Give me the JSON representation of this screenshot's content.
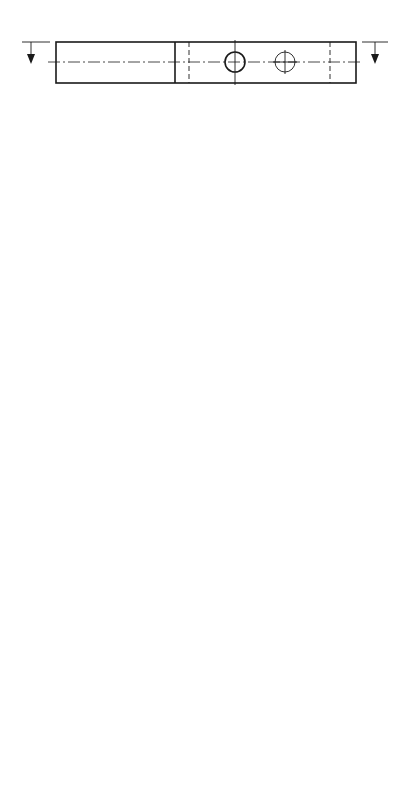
{
  "drawing": {
    "side_view": {
      "section_label_top": "Z",
      "section_label_bottom": "Z",
      "dim_thickness": "50"
    },
    "dimensions": {
      "top_edge": "230",
      "right_edge": "700",
      "chamfer_start": "560",
      "step_right": "150",
      "left_edge": "380",
      "bottom_edge": "150"
    },
    "datum_labels": {
      "x_top": "X",
      "x_bottom": "X",
      "y_left": "Y",
      "y_right": "Y"
    },
    "slot": {
      "text_line1": "SLOT",
      "text_line2": "OUT",
      "end_labels": [
        "E2",
        "E1"
      ]
    },
    "center_lines": [
      "C1",
      "C2",
      "C3",
      "C4"
    ],
    "main_bore": {
      "label": "F1"
    },
    "holes_a": [
      "A1",
      "A2",
      "A3",
      "A4"
    ],
    "holes_b": [
      "B1",
      "B2",
      "B3",
      "B4",
      "B5",
      "B6"
    ],
    "holes_d": [
      "D1",
      "D2",
      "D3",
      "D4"
    ]
  }
}
